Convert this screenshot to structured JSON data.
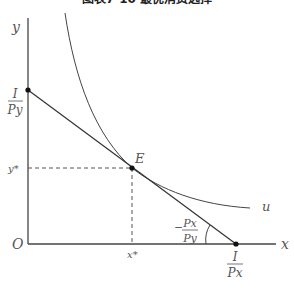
{
  "title": "图表7-10 最优消费选择",
  "axes": {
    "x_label": "x",
    "y_label": "y",
    "origin_label": "O"
  },
  "labels": {
    "y_intercept_num": "I",
    "y_intercept_den": "Py",
    "x_intercept_num": "I",
    "x_intercept_den": "Px",
    "equilibrium": "E",
    "y_star": "y*",
    "x_star": "x*",
    "curve": "u",
    "slope_sign": "−",
    "slope_num": "Px",
    "slope_den": "Py"
  },
  "colors": {
    "line": "#444444",
    "text": "#555555",
    "background": "#ffffff"
  }
}
